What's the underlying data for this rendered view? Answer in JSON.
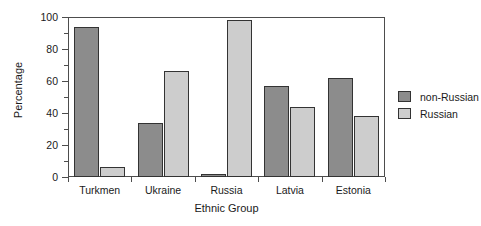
{
  "chart_data": {
    "type": "bar",
    "title": "",
    "xlabel": "Ethnic Group",
    "ylabel": "Percentage",
    "categories": [
      "Turkmen",
      "Ukraine",
      "Russia",
      "Latvia",
      "Estonia"
    ],
    "series": [
      {
        "name": "non-Russian",
        "color": "#8c8c8c",
        "values": [
          94,
          34,
          2,
          57,
          62
        ]
      },
      {
        "name": "Russian",
        "color": "#cdcdcd",
        "values": [
          6,
          66,
          98,
          44,
          38
        ]
      }
    ],
    "ylim": [
      0,
      100
    ],
    "yticks": [
      0,
      20,
      40,
      60,
      80,
      100
    ],
    "ytick_labels": [
      "0",
      "20",
      "40",
      "60",
      "80",
      "100"
    ],
    "yminor_ticks": [
      10,
      30,
      50,
      70,
      90
    ],
    "grid": false,
    "legend_position": "right",
    "legend": [
      "non-Russian",
      "Russian"
    ]
  }
}
